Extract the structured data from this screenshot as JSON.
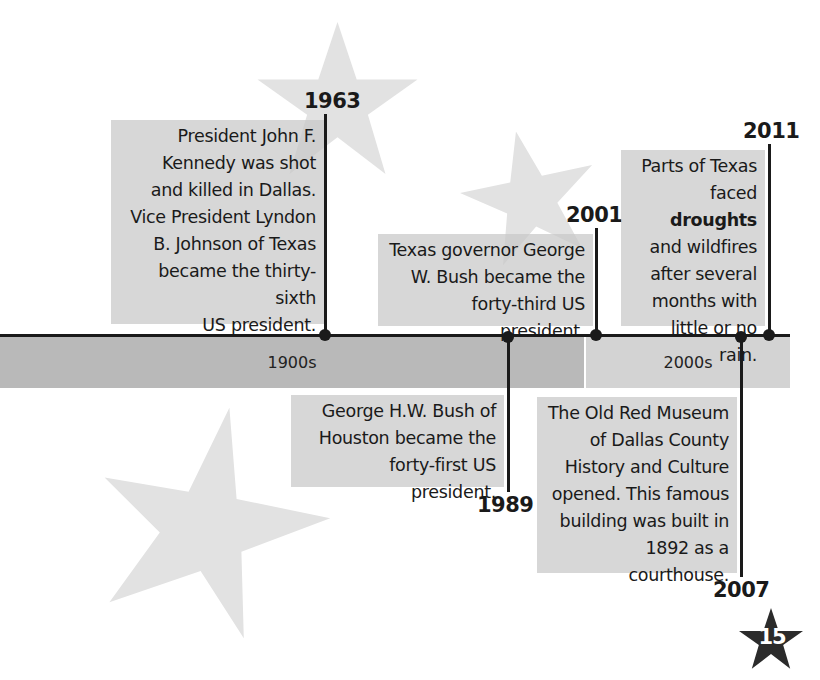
{
  "timeline": {
    "eras": [
      {
        "label": "1900s"
      },
      {
        "label": "2000s"
      }
    ],
    "events": [
      {
        "year": "1963",
        "text": [
          "President John F.",
          "Kennedy was shot",
          "and killed in Dallas.",
          "Vice President Lyndon",
          "B. Johnson of Texas",
          "became the thirty-sixth",
          "US president."
        ]
      },
      {
        "year": "1989",
        "text": [
          "George H.W. Bush of",
          "Houston became the",
          "forty-first US president."
        ]
      },
      {
        "year": "2001",
        "text": [
          "Texas governor George",
          "W. Bush became the",
          "forty-third US president."
        ]
      },
      {
        "year": "2007",
        "text": [
          "The Old Red Museum",
          "of Dallas County",
          "History and Culture",
          "opened. This famous",
          "building was built in",
          "1892 as a courthouse."
        ]
      },
      {
        "year": "2011",
        "text_parts": {
          "line1": "Parts of Texas",
          "line2_pre": "faced ",
          "line2_bold": "droughts",
          "line3": "and wildfires",
          "line4": "after several",
          "line5": "months with",
          "line6": "little or no rain."
        }
      }
    ]
  },
  "page_number": "15",
  "colors": {
    "text": "#1a1a1a",
    "box_bg": "#c8c8c8",
    "era_1900s": "#b9b9b9",
    "era_2000s": "#d3d3d3",
    "star_light": "#e2e2e2",
    "star_dark": "#2b2b2b"
  }
}
